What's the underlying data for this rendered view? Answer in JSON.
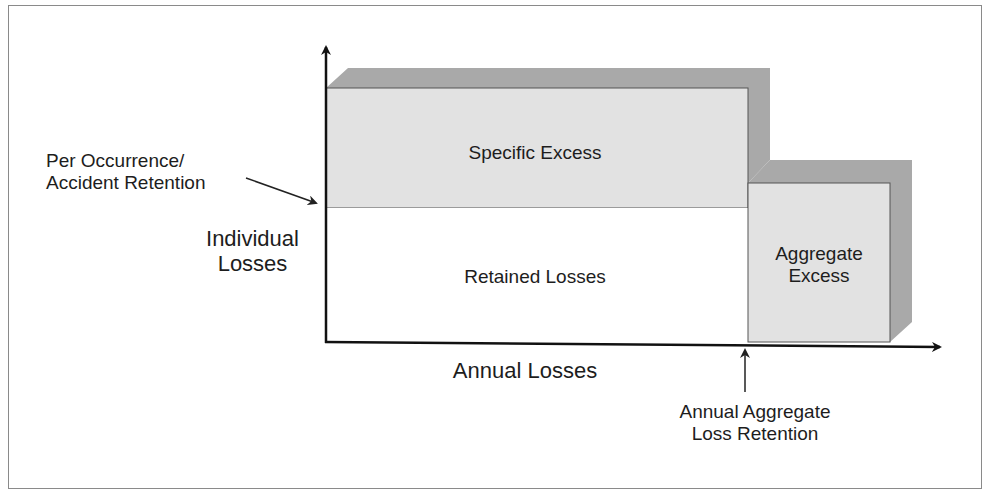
{
  "diagram": {
    "type": "insurance-retention-layers",
    "axes": {
      "y_label_line1": "Individual",
      "y_label_line2": "Losses",
      "x_label": "Annual Losses"
    },
    "regions": {
      "specific_excess": "Specific Excess",
      "retained_losses": "Retained Losses",
      "aggregate_excess_line1": "Aggregate",
      "aggregate_excess_line2": "Excess"
    },
    "annotations": {
      "per_occurrence_line1": "Per Occurrence/",
      "per_occurrence_line2": "Accident Retention",
      "annual_aggregate_line1": "Annual Aggregate",
      "annual_aggregate_line2": "Loss Retention"
    },
    "colors": {
      "box_face": "#e2e2e2",
      "box_shadow": "#a9a9a9",
      "axis": "#111111",
      "border": "#8a8a8a"
    }
  }
}
